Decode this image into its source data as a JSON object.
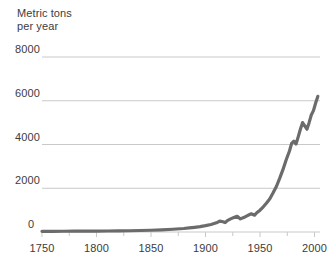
{
  "chart_data": {
    "type": "line",
    "title": "Metric tons\nper year",
    "xlabel": "",
    "ylabel": "Metric tons per year",
    "xlim": [
      1750,
      2005
    ],
    "ylim": [
      0,
      8000
    ],
    "grid": true,
    "legend": null,
    "y_ticks": [
      0,
      2000,
      4000,
      6000,
      8000
    ],
    "y_tick_labels": [
      "0",
      "2000",
      "4000",
      "6000",
      "8000"
    ],
    "x_ticks": [
      1750,
      1800,
      1850,
      1900,
      1950,
      2000
    ],
    "x_tick_labels": [
      "1750",
      "1800",
      "1850",
      "1900",
      "1950",
      "2000"
    ],
    "x_minor_ticks": [
      1775,
      1825,
      1875,
      1925,
      1975
    ],
    "line_color": "#6b6b6b",
    "line_width": 3.2,
    "grid_color": "#c9c9c9",
    "series": [
      {
        "name": "Metric tons per year",
        "x": [
          1750,
          1760,
          1770,
          1780,
          1790,
          1800,
          1810,
          1820,
          1830,
          1840,
          1850,
          1860,
          1870,
          1880,
          1885,
          1890,
          1895,
          1900,
          1905,
          1910,
          1913,
          1916,
          1918,
          1920,
          1923,
          1926,
          1929,
          1932,
          1935,
          1938,
          1940,
          1942,
          1945,
          1947,
          1950,
          1953,
          1956,
          1959,
          1962,
          1965,
          1968,
          1971,
          1974,
          1977,
          1979,
          1981,
          1983,
          1985,
          1987,
          1989,
          1991,
          1993,
          1995,
          1997,
          1999,
          2001,
          2003
        ],
        "y": [
          30,
          32,
          34,
          36,
          38,
          42,
          46,
          52,
          58,
          68,
          80,
          100,
          125,
          160,
          185,
          215,
          245,
          290,
          345,
          420,
          500,
          470,
          430,
          520,
          600,
          660,
          720,
          600,
          660,
          740,
          790,
          830,
          770,
          880,
          1000,
          1150,
          1330,
          1520,
          1790,
          2080,
          2450,
          2850,
          3300,
          3700,
          4050,
          4150,
          4020,
          4350,
          4700,
          5000,
          4850,
          4700,
          5000,
          5350,
          5550,
          5900,
          6200
        ],
        "units": "metric tons per year"
      }
    ]
  }
}
